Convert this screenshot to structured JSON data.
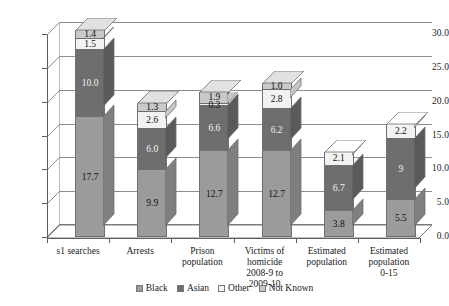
{
  "chart_data": {
    "type": "bar",
    "subtype": "stacked-3d-column",
    "title": "",
    "subtitle": "",
    "xlabel": "",
    "ylabel": "",
    "ylim": [
      0.0,
      30.0
    ],
    "ytick_step": 5.0,
    "ytick_labels": [
      "30.0",
      "25.0",
      "20.0",
      "15.0",
      "10.0",
      "5.0",
      "0.0"
    ],
    "ytick_values": [
      30.0,
      25.0,
      20.0,
      15.0,
      10.0,
      5.0,
      0.0
    ],
    "grid": true,
    "grid_axis": "y",
    "legend_position": "bottom",
    "categories": [
      "s1 searches",
      "Arrests",
      "Prison population",
      "Victims of homicide 2008-9 to 2009-10",
      "Estimated population",
      "Estimated population 0-15"
    ],
    "category_lines": [
      [
        "s1 searches"
      ],
      [
        "Arrests"
      ],
      [
        "Prison",
        "population"
      ],
      [
        "Victims of",
        "homicide",
        "2008-9 to",
        "2009-10"
      ],
      [
        "Estimated",
        "population"
      ],
      [
        "Estimated",
        "population",
        "0-15"
      ]
    ],
    "series": [
      {
        "name": "Black",
        "color": "#9b9b9b",
        "values": [
          17.7,
          9.9,
          12.7,
          12.7,
          3.8,
          5.5
        ],
        "labels": [
          "17.7",
          "9.9",
          "12.7",
          "12.7",
          "3.8",
          "5.5"
        ]
      },
      {
        "name": "Asian",
        "color": "#6e6e6e",
        "values": [
          10.0,
          6.0,
          6.6,
          6.2,
          6.7,
          9.0
        ],
        "labels": [
          "10.0",
          "6.0",
          "6.6",
          "6.2",
          "6.7",
          "9"
        ]
      },
      {
        "name": "Other",
        "color": "#f2f2f2",
        "values": [
          1.5,
          2.6,
          0.3,
          2.8,
          2.1,
          2.2
        ],
        "labels": [
          "1.5",
          "2.6",
          "0.3",
          "2.8",
          "2.1",
          "2.2"
        ]
      },
      {
        "name": "Not Known",
        "color": "#c9c9c9",
        "values": [
          1.4,
          1.3,
          1.9,
          1.0,
          0.0,
          0.0
        ],
        "labels": [
          "1.4",
          "1.3",
          "1.9",
          "1.0",
          "",
          ""
        ]
      }
    ],
    "totals": [
      30.6,
      19.8,
      21.5,
      22.7,
      12.6,
      16.7
    ]
  },
  "legend": {
    "items": [
      {
        "label": "Black",
        "color": "#9b9b9b"
      },
      {
        "label": "Asian",
        "color": "#6e6e6e"
      },
      {
        "label": "Other",
        "color": "#f2f2f2"
      },
      {
        "label": "Not Known",
        "color": "#c9c9c9"
      }
    ]
  },
  "colors": {
    "black_series": "#9b9b9b",
    "asian_series": "#6e6e6e",
    "other_series": "#f2f2f2",
    "notknown_series": "#c9c9c9",
    "axis": "#5e5e5e",
    "grid": "#8d8d8d",
    "background": "#ffffff"
  }
}
